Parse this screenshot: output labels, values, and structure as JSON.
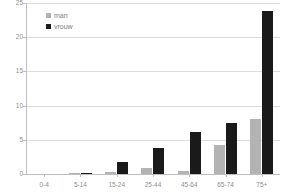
{
  "chart_data": {
    "type": "bar",
    "title": "",
    "subtitle": "",
    "xlabel": "",
    "ylabel": "",
    "categories": [
      "0-4",
      "5-14",
      "15-24",
      "25-44",
      "45-64",
      "65-74",
      "75+"
    ],
    "series": [
      {
        "name": "man",
        "color": "#b3b3b3",
        "values": [
          0,
          0.1,
          0.3,
          0.9,
          0.5,
          4.2,
          8.0
        ]
      },
      {
        "name": "vrouw",
        "color": "#1a1a1a",
        "values": [
          0,
          0.1,
          1.8,
          3.8,
          6.1,
          7.5,
          23.8
        ]
      }
    ],
    "ylim": [
      0,
      25
    ],
    "yticks": [
      0,
      5,
      10,
      15,
      20,
      25
    ],
    "ytick_labels": [
      "0",
      "5",
      "10",
      "15",
      "20",
      "25"
    ],
    "grid": true,
    "legend_position": "top-left",
    "legend_entries": [
      "man",
      "vrouw"
    ],
    "annotations": []
  }
}
